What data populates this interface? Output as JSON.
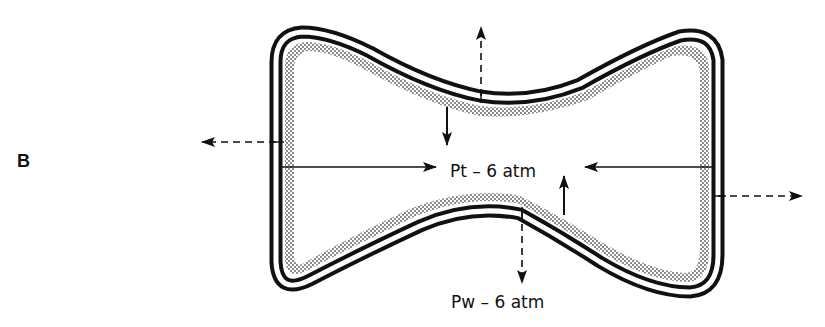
{
  "panel": {
    "label": "B"
  },
  "labels": {
    "turgor_pressure": "Pt – 6 atm",
    "wall_pressure": "Pw – 6 atm"
  },
  "colors": {
    "ink": "#111111",
    "stipple": "#777777",
    "background": "#ffffff"
  },
  "arrows": [
    {
      "name": "turgor-arrow-left-to-right",
      "style": "solid",
      "direction": "right"
    },
    {
      "name": "turgor-arrow-right-to-left",
      "style": "solid",
      "direction": "left"
    },
    {
      "name": "turgor-arrow-top-down",
      "style": "solid",
      "direction": "down"
    },
    {
      "name": "turgor-arrow-bottom-up",
      "style": "solid",
      "direction": "up"
    },
    {
      "name": "wall-arrow-left",
      "style": "dashed",
      "direction": "left"
    },
    {
      "name": "wall-arrow-right",
      "style": "dashed",
      "direction": "right"
    },
    {
      "name": "wall-arrow-up",
      "style": "dashed",
      "direction": "up"
    },
    {
      "name": "wall-arrow-down",
      "style": "dashed",
      "direction": "down"
    }
  ]
}
